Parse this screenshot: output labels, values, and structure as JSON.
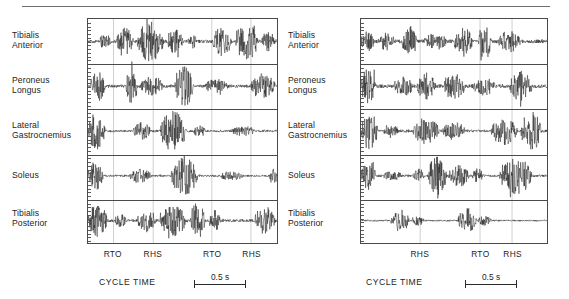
{
  "figure": {
    "panels": [
      {
        "id": "left",
        "muscles": [
          {
            "line1": "Tibialis",
            "line2": "Anterior"
          },
          {
            "line1": "Peroneus",
            "line2": "Longus"
          },
          {
            "line1": "Lateral",
            "line2": "Gastrocnemius"
          },
          {
            "line1": "Soleus",
            "line2": ""
          },
          {
            "line1": "Tibialis",
            "line2": "Posterior"
          }
        ],
        "events": [
          {
            "label": "RTO",
            "x_frac": 0.135
          },
          {
            "label": "RHS",
            "x_frac": 0.345
          },
          {
            "label": "RTO",
            "x_frac": 0.655
          },
          {
            "label": "RHS",
            "x_frac": 0.862
          }
        ],
        "gridlines": [
          0.135,
          0.345,
          0.655,
          0.862
        ],
        "axis_caption": "CYCLE  TIME",
        "scale_label": "0.5 s"
      },
      {
        "id": "right",
        "muscles": [
          {
            "line1": "Tibialis",
            "line2": "Anterior"
          },
          {
            "line1": "Peroneus",
            "line2": "Longus"
          },
          {
            "line1": "Lateral",
            "line2": "Gastrocnemius"
          },
          {
            "line1": "Soleus",
            "line2": ""
          },
          {
            "line1": "Tibialis",
            "line2": "Posterior"
          }
        ],
        "events": [
          {
            "label": "RHS",
            "x_frac": 0.318
          },
          {
            "label": "RTO",
            "x_frac": 0.64
          },
          {
            "label": "RHS",
            "x_frac": 0.812
          }
        ],
        "gridlines": [
          0.318,
          0.64,
          0.812
        ],
        "axis_caption": "CYCLE  TIME",
        "scale_label": "0.5 s"
      }
    ]
  },
  "chart_data": {
    "type": "line",
    "title": "",
    "xlabel": "CYCLE  TIME",
    "ylabel": "",
    "grid": true,
    "legend": "none",
    "scale_bar": {
      "length_label": "0.5 s",
      "value": 0.5,
      "unit": "s"
    },
    "channels": [
      "Tibialis Anterior",
      "Peroneus Longus",
      "Lateral Gastrocnemius",
      "Soleus",
      "Tibialis Posterior"
    ],
    "panels": [
      {
        "name": "left",
        "gait_events": [
          {
            "label": "RTO",
            "x_frac": 0.135
          },
          {
            "label": "RHS",
            "x_frac": 0.345
          },
          {
            "label": "RTO",
            "x_frac": 0.655
          },
          {
            "label": "RHS",
            "x_frac": 0.862
          }
        ],
        "series": [
          {
            "name": "Tibialis Anterior",
            "bursts": [
              {
                "start": 0.06,
                "end": 0.12,
                "amp": 0.3
              },
              {
                "start": 0.15,
                "end": 0.24,
                "amp": 0.62
              },
              {
                "start": 0.26,
                "end": 0.4,
                "amp": 0.95
              },
              {
                "start": 0.42,
                "end": 0.5,
                "amp": 0.55
              },
              {
                "start": 0.53,
                "end": 0.58,
                "amp": 0.35
              },
              {
                "start": 0.66,
                "end": 0.76,
                "amp": 0.68
              },
              {
                "start": 0.78,
                "end": 0.9,
                "amp": 0.88
              },
              {
                "start": 0.92,
                "end": 0.99,
                "amp": 0.45
              }
            ],
            "baseline": 0.08
          },
          {
            "name": "Peroneus Longus",
            "bursts": [
              {
                "start": 0.01,
                "end": 0.09,
                "amp": 0.7
              },
              {
                "start": 0.2,
                "end": 0.26,
                "amp": 0.85
              },
              {
                "start": 0.28,
                "end": 0.4,
                "amp": 0.45
              },
              {
                "start": 0.46,
                "end": 0.56,
                "amp": 0.92
              },
              {
                "start": 0.62,
                "end": 0.74,
                "amp": 0.3
              },
              {
                "start": 0.86,
                "end": 0.99,
                "amp": 0.58
              }
            ],
            "baseline": 0.08
          },
          {
            "name": "Lateral Gastrocnemius",
            "bursts": [
              {
                "start": 0.0,
                "end": 0.09,
                "amp": 0.9
              },
              {
                "start": 0.24,
                "end": 0.33,
                "amp": 0.42
              },
              {
                "start": 0.38,
                "end": 0.52,
                "amp": 0.98
              },
              {
                "start": 0.56,
                "end": 0.62,
                "amp": 0.25
              },
              {
                "start": 0.76,
                "end": 0.88,
                "amp": 0.22
              }
            ],
            "baseline": 0.06
          },
          {
            "name": "Soleus",
            "bursts": [
              {
                "start": 0.0,
                "end": 0.08,
                "amp": 0.72
              },
              {
                "start": 0.22,
                "end": 0.34,
                "amp": 0.3
              },
              {
                "start": 0.44,
                "end": 0.58,
                "amp": 0.96
              },
              {
                "start": 0.7,
                "end": 0.82,
                "amp": 0.2
              },
              {
                "start": 0.96,
                "end": 1.0,
                "amp": 0.42
              }
            ],
            "baseline": 0.05
          },
          {
            "name": "Tibialis Posterior",
            "bursts": [
              {
                "start": 0.0,
                "end": 0.1,
                "amp": 0.8
              },
              {
                "start": 0.14,
                "end": 0.2,
                "amp": 0.28
              },
              {
                "start": 0.26,
                "end": 0.36,
                "amp": 0.52
              },
              {
                "start": 0.38,
                "end": 0.52,
                "amp": 0.75
              },
              {
                "start": 0.54,
                "end": 0.62,
                "amp": 0.95
              },
              {
                "start": 0.64,
                "end": 0.7,
                "amp": 0.48
              },
              {
                "start": 0.88,
                "end": 0.99,
                "amp": 0.66
              }
            ],
            "baseline": 0.07
          }
        ]
      },
      {
        "name": "right",
        "gait_events": [
          {
            "label": "RHS",
            "x_frac": 0.318
          },
          {
            "label": "RTO",
            "x_frac": 0.64
          },
          {
            "label": "RHS",
            "x_frac": 0.812
          }
        ],
        "series": [
          {
            "name": "Tibialis Anterior",
            "bursts": [
              {
                "start": 0.0,
                "end": 0.07,
                "amp": 0.45
              },
              {
                "start": 0.1,
                "end": 0.18,
                "amp": 0.4
              },
              {
                "start": 0.22,
                "end": 0.3,
                "amp": 0.72
              },
              {
                "start": 0.34,
                "end": 0.46,
                "amp": 0.35
              },
              {
                "start": 0.5,
                "end": 0.6,
                "amp": 0.62
              },
              {
                "start": 0.63,
                "end": 0.7,
                "amp": 0.9
              },
              {
                "start": 0.74,
                "end": 0.86,
                "amp": 0.48
              }
            ],
            "baseline": 0.09
          },
          {
            "name": "Peroneus Longus",
            "bursts": [
              {
                "start": 0.0,
                "end": 0.08,
                "amp": 0.82
              },
              {
                "start": 0.18,
                "end": 0.28,
                "amp": 0.4
              },
              {
                "start": 0.3,
                "end": 0.4,
                "amp": 0.62
              },
              {
                "start": 0.44,
                "end": 0.56,
                "amp": 0.58
              },
              {
                "start": 0.6,
                "end": 0.72,
                "amp": 0.38
              },
              {
                "start": 0.8,
                "end": 0.92,
                "amp": 0.7
              }
            ],
            "baseline": 0.09
          },
          {
            "name": "Lateral Gastrocnemius",
            "bursts": [
              {
                "start": 0.0,
                "end": 0.09,
                "amp": 0.88
              },
              {
                "start": 0.12,
                "end": 0.2,
                "amp": 0.28
              },
              {
                "start": 0.28,
                "end": 0.42,
                "amp": 0.62
              },
              {
                "start": 0.44,
                "end": 0.56,
                "amp": 0.4
              },
              {
                "start": 0.7,
                "end": 0.84,
                "amp": 0.66
              },
              {
                "start": 0.86,
                "end": 0.97,
                "amp": 0.98
              }
            ],
            "baseline": 0.07
          },
          {
            "name": "Soleus",
            "bursts": [
              {
                "start": 0.0,
                "end": 0.08,
                "amp": 0.7
              },
              {
                "start": 0.12,
                "end": 0.22,
                "amp": 0.18
              },
              {
                "start": 0.28,
                "end": 0.34,
                "amp": 0.3
              },
              {
                "start": 0.36,
                "end": 0.46,
                "amp": 0.95
              },
              {
                "start": 0.47,
                "end": 0.58,
                "amp": 0.5
              },
              {
                "start": 0.6,
                "end": 0.66,
                "amp": 0.32
              },
              {
                "start": 0.74,
                "end": 0.92,
                "amp": 0.88
              }
            ],
            "baseline": 0.06
          },
          {
            "name": "Tibialis Posterior",
            "bursts": [
              {
                "start": 0.16,
                "end": 0.26,
                "amp": 0.55
              },
              {
                "start": 0.27,
                "end": 0.34,
                "amp": 0.22
              },
              {
                "start": 0.52,
                "end": 0.62,
                "amp": 0.6
              },
              {
                "start": 0.63,
                "end": 0.7,
                "amp": 0.22
              }
            ],
            "baseline": 0.04
          }
        ]
      }
    ]
  }
}
